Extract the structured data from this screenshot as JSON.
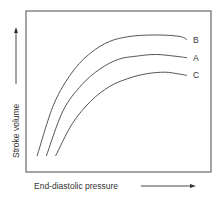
{
  "chart_data": {
    "type": "line",
    "title": "",
    "xlabel": "End-diastolic pressure",
    "ylabel": "Stroke volume",
    "xlim": [
      0,
      1
    ],
    "ylim": [
      0,
      1
    ],
    "grid": false,
    "ticks": "none",
    "axis_arrows": true,
    "legend": "inline-right",
    "series": [
      {
        "name": "B",
        "x": [
          0.06,
          0.15,
          0.25,
          0.35,
          0.45,
          0.55,
          0.65,
          0.75,
          0.84,
          0.87
        ],
        "y": [
          0.1,
          0.42,
          0.62,
          0.74,
          0.81,
          0.84,
          0.85,
          0.85,
          0.84,
          0.82
        ]
      },
      {
        "name": "A",
        "x": [
          0.11,
          0.2,
          0.3,
          0.4,
          0.5,
          0.6,
          0.7,
          0.8,
          0.87
        ],
        "y": [
          0.1,
          0.38,
          0.54,
          0.64,
          0.7,
          0.72,
          0.73,
          0.72,
          0.71
        ]
      },
      {
        "name": "C",
        "x": [
          0.16,
          0.25,
          0.35,
          0.45,
          0.55,
          0.65,
          0.75,
          0.82,
          0.87
        ],
        "y": [
          0.1,
          0.3,
          0.44,
          0.53,
          0.58,
          0.61,
          0.62,
          0.61,
          0.6
        ]
      }
    ],
    "colors": {
      "line": "#555555",
      "frame": "#6a6a6a",
      "text": "#333333"
    }
  }
}
